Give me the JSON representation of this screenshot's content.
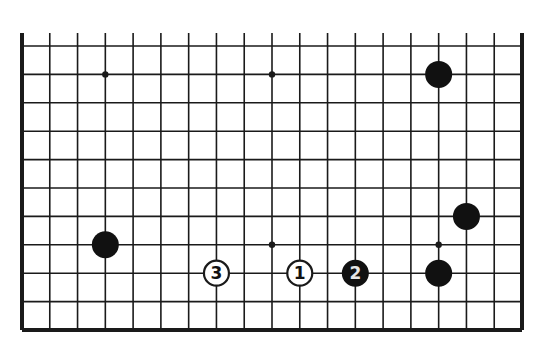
{
  "diagram": {
    "type": "go-board-fragment",
    "columns": 19,
    "rows": 11,
    "open_edge": "top",
    "colors": {
      "background": "#ffffff",
      "line": "#1a1a1a",
      "black_stone": "#111111",
      "white_stone": "#ffffff",
      "black_label": "#e6e6e6",
      "white_label": "#111111"
    },
    "star_points": [
      {
        "col": 3,
        "row": 1
      },
      {
        "col": 9,
        "row": 1
      },
      {
        "col": 9,
        "row": 7
      },
      {
        "col": 15,
        "row": 7
      }
    ],
    "stones": [
      {
        "color": "black",
        "col": 15,
        "row": 1,
        "label": ""
      },
      {
        "color": "black",
        "col": 16,
        "row": 6,
        "label": ""
      },
      {
        "color": "black",
        "col": 3,
        "row": 7,
        "label": ""
      },
      {
        "color": "black",
        "col": 15,
        "row": 8,
        "label": ""
      },
      {
        "color": "white",
        "col": 10,
        "row": 8,
        "label": "1"
      },
      {
        "color": "black",
        "col": 12,
        "row": 8,
        "label": "2"
      },
      {
        "color": "white",
        "col": 7,
        "row": 8,
        "label": "3"
      }
    ]
  }
}
